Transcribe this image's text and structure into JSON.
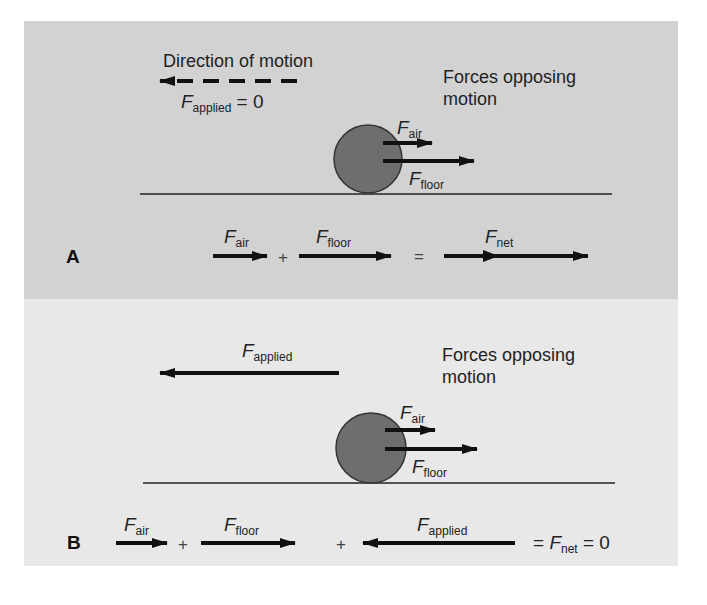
{
  "panels": {
    "a": {
      "letter": "A",
      "direction_label": "Direction of motion",
      "applied_label": {
        "symbol": "F",
        "subscript": "applied",
        "suffix": " = 0"
      },
      "opposing_label_line1": "Forces opposing",
      "opposing_label_line2": "motion",
      "ball_forces": {
        "air": {
          "symbol": "F",
          "subscript": "air"
        },
        "floor": {
          "symbol": "F",
          "subscript": "floor"
        }
      },
      "equation": {
        "air": {
          "symbol": "F",
          "subscript": "air"
        },
        "plus": "+",
        "floor": {
          "symbol": "F",
          "subscript": "floor"
        },
        "equals": "=",
        "net": {
          "symbol": "F",
          "subscript": "net"
        }
      }
    },
    "b": {
      "letter": "B",
      "applied_label": {
        "symbol": "F",
        "subscript": "applied"
      },
      "opposing_label_line1": "Forces opposing",
      "opposing_label_line2": "motion",
      "ball_forces": {
        "air": {
          "symbol": "F",
          "subscript": "air"
        },
        "floor": {
          "symbol": "F",
          "subscript": "floor"
        }
      },
      "equation": {
        "air": {
          "symbol": "F",
          "subscript": "air"
        },
        "plus1": "+",
        "floor": {
          "symbol": "F",
          "subscript": "floor"
        },
        "plus2": "+",
        "applied": {
          "symbol": "F",
          "subscript": "applied"
        },
        "result_prefix": "= ",
        "net": {
          "symbol": "F",
          "subscript": "net"
        },
        "result_suffix": " = 0"
      }
    }
  },
  "colors": {
    "panel_a_bg": "#d2d2d2",
    "panel_b_bg": "#e8e8e8",
    "ball_fill": "#6e6e6e",
    "arrow": "#111111"
  }
}
